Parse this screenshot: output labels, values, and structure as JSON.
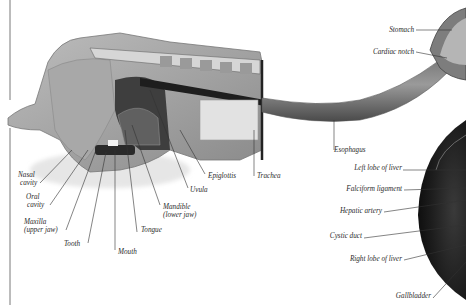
{
  "diagram": {
    "style": "grayscale anatomical illustration with italic serif leader labels",
    "colors": {
      "background": "#ffffff",
      "label_text": "#2a2a2a",
      "leader_line": "#333333",
      "tissue_light": "#d9d9d9",
      "tissue_mid": "#8c8c8c",
      "tissue_dark": "#2b2b2b",
      "liver": "#1f1f1f"
    },
    "labels": {
      "nasal_cavity": [
        "Nasal",
        "cavity"
      ],
      "oral_cavity": [
        "Oral",
        "cavity"
      ],
      "maxilla": [
        "Maxilla",
        "(upper jaw)"
      ],
      "tooth": "Tooth",
      "mouth": "Mouth",
      "tongue": "Tongue",
      "mandible": [
        "Mandible",
        "(lower jaw)"
      ],
      "uvula": "Uvula",
      "epiglottis": "Epiglottis",
      "trachea": "Trachea",
      "esophagus": "Esophagus",
      "stomach": "Stomach",
      "cardiac_notch": "Cardiac notch",
      "left_lobe_of_liver": "Left lobe of liver",
      "falciform_ligament": "Falciform ligament",
      "hepatic_artery": "Hepatic artery",
      "cystic_duct": "Cystic duct",
      "right_lobe_of_liver": "Right lobe of liver",
      "gallbladder": "Gallbladder"
    }
  }
}
